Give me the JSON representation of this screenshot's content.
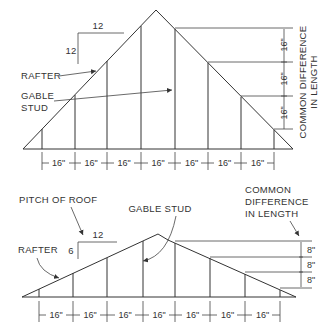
{
  "top_diagram": {
    "pitch_run": "12",
    "pitch_rise": "12",
    "labels": {
      "rafter": "RAFTER",
      "gable_stud_line1": "GABLE",
      "gable_stud_line2": "STUD",
      "common_diff_line1": "COMMON DIFFERENCE",
      "common_diff_line2": "IN LENGTH"
    },
    "spacing_dims": [
      "16\"",
      "16\"",
      "16\"",
      "16\"",
      "16\"",
      "16\"",
      "16\""
    ],
    "vertical_dims": [
      "16\"",
      "16\"",
      "16\""
    ]
  },
  "bottom_diagram": {
    "pitch_run": "12",
    "pitch_rise": "6",
    "labels": {
      "pitch_of_roof": "PITCH OF ROOF",
      "rafter": "RAFTER",
      "gable_stud": "GABLE STUD",
      "common_diff_line1": "COMMON",
      "common_diff_line2": "DIFFERENCE",
      "common_diff_line3": "IN LENGTH"
    },
    "spacing_dims": [
      "16\"",
      "16\"",
      "16\"",
      "16\"",
      "16\"",
      "16\"",
      "16\""
    ],
    "vertical_dims": [
      "8\"",
      "8\"",
      "8\""
    ]
  }
}
